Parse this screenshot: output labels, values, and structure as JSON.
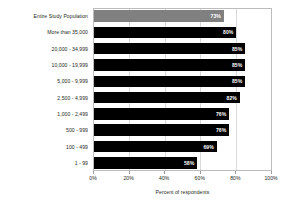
{
  "chart_data": {
    "type": "bar",
    "orientation": "horizontal",
    "title": "",
    "xlabel": "Percent of respondents",
    "ylabel": "",
    "xlim": [
      0,
      100
    ],
    "xticks": [
      "0%",
      "20%",
      "40%",
      "60%",
      "80%",
      "100%"
    ],
    "xtick_values": [
      0,
      20,
      40,
      60,
      80,
      100
    ],
    "grid": true,
    "legend": "none",
    "categories": [
      "Entire Study Population",
      "More than 35,000",
      "20,000 - 34,999",
      "10,000 - 19,999",
      "5,000 - 9,999",
      "2,500 - 4,999",
      "1,000 - 2,499",
      "500 - 999",
      "100 - 499",
      "1 - 99"
    ],
    "values": [
      73,
      80,
      85,
      85,
      85,
      82,
      76,
      76,
      69,
      58
    ],
    "value_labels": [
      "73%",
      "80%",
      "85%",
      "85%",
      "85%",
      "82%",
      "76%",
      "76%",
      "69%",
      "58%"
    ],
    "bar_colors": [
      "#808080",
      "#000000",
      "#000000",
      "#000000",
      "#000000",
      "#000000",
      "#000000",
      "#000000",
      "#000000",
      "#000000"
    ],
    "highlight_index": 0,
    "colors": {
      "bar_default": "#000000",
      "bar_highlight": "#808080",
      "value_text": "#ffffff",
      "axis_text": "#231f20",
      "gridline": "#d9d9d9",
      "frame": "#bcbcbc",
      "background": "#ffffff"
    }
  }
}
